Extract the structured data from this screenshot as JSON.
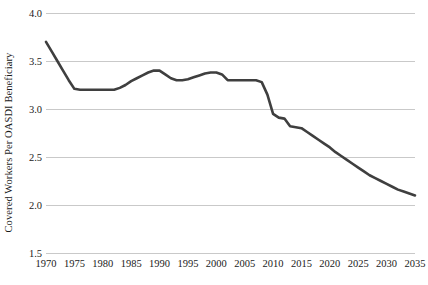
{
  "chart_data": {
    "type": "line",
    "title": "",
    "subtitle": "",
    "xlabel": "",
    "ylabel": "Covered Workers Per OASDI Beneficiary",
    "xlim": [
      1970,
      2035
    ],
    "ylim": [
      1.5,
      4.0
    ],
    "y_ticks": [
      4.0,
      3.5,
      3.0,
      2.5,
      2.0,
      1.5
    ],
    "y_tick_labels": [
      "4.0",
      "3.5",
      "3.0",
      "2.5",
      "2.0",
      "1.5"
    ],
    "x_ticks": [
      1970,
      1975,
      1980,
      1985,
      1990,
      1995,
      2000,
      2005,
      2010,
      2015,
      2020,
      2025,
      2030,
      2035
    ],
    "x_tick_labels": [
      "1970",
      "1975",
      "1980",
      "1985",
      "1990",
      "1995",
      "2000",
      "2005",
      "2010",
      "2015",
      "2020",
      "2025",
      "2030",
      "2035"
    ],
    "grid": true,
    "grid_axis": "y",
    "legend": false,
    "legend_position": "none",
    "line_color": "#3f3f3f",
    "line_width": 2.6,
    "background_color": "#ffffff",
    "gridline_color": "#c9c9c9",
    "text_color": "#1a1a1a",
    "series": [
      {
        "name": "Covered Workers Per OASDI Beneficiary",
        "x": [
          1970,
          1971,
          1972,
          1973,
          1974,
          1975,
          1976,
          1977,
          1978,
          1979,
          1980,
          1981,
          1982,
          1983,
          1984,
          1985,
          1986,
          1987,
          1988,
          1989,
          1990,
          1991,
          1992,
          1993,
          1994,
          1995,
          1996,
          1997,
          1998,
          1999,
          2000,
          2001,
          2002,
          2003,
          2004,
          2005,
          2006,
          2007,
          2008,
          2009,
          2010,
          2011,
          2012,
          2013,
          2014,
          2015,
          2016,
          2017,
          2018,
          2019,
          2020,
          2021,
          2022,
          2023,
          2024,
          2025,
          2026,
          2027,
          2028,
          2029,
          2030,
          2031,
          2032,
          2033,
          2034,
          2035
        ],
        "values": [
          3.7,
          3.6,
          3.5,
          3.4,
          3.3,
          3.21,
          3.2,
          3.2,
          3.2,
          3.2,
          3.2,
          3.2,
          3.2,
          3.22,
          3.25,
          3.29,
          3.32,
          3.35,
          3.38,
          3.4,
          3.4,
          3.36,
          3.32,
          3.3,
          3.3,
          3.31,
          3.33,
          3.35,
          3.37,
          3.38,
          3.38,
          3.36,
          3.3,
          3.3,
          3.3,
          3.3,
          3.3,
          3.3,
          3.28,
          3.15,
          2.95,
          2.91,
          2.9,
          2.82,
          2.81,
          2.8,
          2.76,
          2.72,
          2.68,
          2.64,
          2.6,
          2.55,
          2.51,
          2.47,
          2.43,
          2.39,
          2.35,
          2.31,
          2.28,
          2.25,
          2.22,
          2.19,
          2.16,
          2.14,
          2.12,
          2.1
        ]
      }
    ]
  }
}
